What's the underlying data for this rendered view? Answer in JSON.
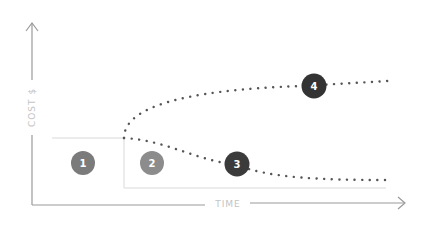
{
  "diagram": {
    "y_axis": {
      "label": "COST $"
    },
    "x_axis": {
      "label": "TIME"
    },
    "markers": [
      {
        "id": "1",
        "label": "1",
        "color": "#7b7b7b"
      },
      {
        "id": "2",
        "label": "2",
        "color": "#8c8c8c"
      },
      {
        "id": "3",
        "label": "3",
        "color": "#3b3b3b"
      },
      {
        "id": "4",
        "label": "4",
        "color": "#333333"
      }
    ],
    "colors": {
      "axis": "#9a9a9a",
      "baseline": "#e6e6e6",
      "dots": "#555555"
    }
  }
}
